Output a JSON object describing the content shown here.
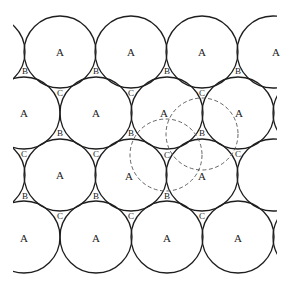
{
  "diagram": {
    "colors": {
      "stroke": "#1e1e1e",
      "dashed_stroke": "#555555",
      "text": "#222222",
      "background": "#ffffff"
    },
    "clip": {
      "x": 13,
      "y": 14,
      "width": 264,
      "height": 262
    },
    "radius": 36,
    "solid_circles": [
      {
        "cx": -11,
        "cy": 52
      },
      {
        "cx": 60,
        "cy": 52
      },
      {
        "cx": 131,
        "cy": 52
      },
      {
        "cx": 202,
        "cy": 52
      },
      {
        "cx": 273,
        "cy": 52
      },
      {
        "cx": 24,
        "cy": 113
      },
      {
        "cx": 96,
        "cy": 113
      },
      {
        "cx": 167,
        "cy": 113
      },
      {
        "cx": 238,
        "cy": 113
      },
      {
        "cx": 309,
        "cy": 113
      },
      {
        "cx": -11,
        "cy": 175
      },
      {
        "cx": 60,
        "cy": 175
      },
      {
        "cx": 131,
        "cy": 175
      },
      {
        "cx": 202,
        "cy": 175
      },
      {
        "cx": 273,
        "cy": 175
      },
      {
        "cx": 24,
        "cy": 237
      },
      {
        "cx": 96,
        "cy": 237
      },
      {
        "cx": 167,
        "cy": 237
      },
      {
        "cx": 238,
        "cy": 237
      },
      {
        "cx": 309,
        "cy": 237
      }
    ],
    "dashed_circles": [
      {
        "cx": 166,
        "cy": 155,
        "note": "sphere over C void"
      },
      {
        "cx": 202,
        "cy": 134,
        "note": "sphere over B void"
      }
    ],
    "labels": [
      {
        "text": "A",
        "x": 60,
        "y": 52,
        "kind": "a"
      },
      {
        "text": "A",
        "x": 131,
        "y": 52,
        "kind": "a"
      },
      {
        "text": "A",
        "x": 202,
        "y": 52,
        "kind": "a"
      },
      {
        "text": "A",
        "x": 276,
        "y": 52,
        "kind": "a"
      },
      {
        "text": "B",
        "x": 25,
        "y": 71,
        "kind": "void"
      },
      {
        "text": "B",
        "x": 96,
        "y": 71,
        "kind": "void"
      },
      {
        "text": "B",
        "x": 167,
        "y": 71,
        "kind": "void"
      },
      {
        "text": "B",
        "x": 238,
        "y": 71,
        "kind": "void"
      },
      {
        "text": "C",
        "x": 60,
        "y": 93,
        "kind": "void"
      },
      {
        "text": "C",
        "x": 131,
        "y": 93,
        "kind": "void"
      },
      {
        "text": "C",
        "x": 202,
        "y": 93,
        "kind": "void"
      },
      {
        "text": "A",
        "x": 24,
        "y": 113,
        "kind": "a"
      },
      {
        "text": "A",
        "x": 96,
        "y": 113,
        "kind": "a"
      },
      {
        "text": "A",
        "x": 164,
        "y": 113,
        "kind": "a"
      },
      {
        "text": "A",
        "x": 239,
        "y": 113,
        "kind": "a"
      },
      {
        "text": "B",
        "x": 60,
        "y": 133,
        "kind": "void"
      },
      {
        "text": "B",
        "x": 131,
        "y": 133,
        "kind": "void"
      },
      {
        "text": "B",
        "x": 202,
        "y": 133,
        "kind": "void"
      },
      {
        "text": "C",
        "x": 24,
        "y": 154,
        "kind": "void"
      },
      {
        "text": "C",
        "x": 96,
        "y": 154,
        "kind": "void"
      },
      {
        "text": "C",
        "x": 167,
        "y": 155,
        "kind": "void"
      },
      {
        "text": "C",
        "x": 238,
        "y": 154,
        "kind": "void"
      },
      {
        "text": "A",
        "x": 60,
        "y": 175,
        "kind": "a"
      },
      {
        "text": "A",
        "x": 129,
        "y": 176,
        "kind": "a"
      },
      {
        "text": "A",
        "x": 202,
        "y": 176,
        "kind": "a"
      },
      {
        "text": "B",
        "x": 25,
        "y": 196,
        "kind": "void"
      },
      {
        "text": "B",
        "x": 96,
        "y": 196,
        "kind": "void"
      },
      {
        "text": "B",
        "x": 167,
        "y": 196,
        "kind": "void"
      },
      {
        "text": "C",
        "x": 60,
        "y": 216,
        "kind": "void"
      },
      {
        "text": "C",
        "x": 131,
        "y": 216,
        "kind": "void"
      },
      {
        "text": "C",
        "x": 202,
        "y": 216,
        "kind": "void"
      },
      {
        "text": "A",
        "x": 24,
        "y": 238,
        "kind": "a"
      },
      {
        "text": "A",
        "x": 96,
        "y": 238,
        "kind": "a"
      },
      {
        "text": "A",
        "x": 167,
        "y": 238,
        "kind": "a"
      },
      {
        "text": "A",
        "x": 238,
        "y": 238,
        "kind": "a"
      }
    ]
  }
}
